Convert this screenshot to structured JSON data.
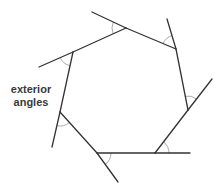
{
  "diagram": {
    "label": {
      "line1": "exterior",
      "line2": "angles",
      "x": 8,
      "y": 83,
      "width": 46
    },
    "colors": {
      "edge": "#333333",
      "arc": "#aaaaaa",
      "text": "#3a3a3a",
      "background": "#ffffff"
    },
    "vertices": [
      {
        "name": "A",
        "x": 126,
        "y": 28
      },
      {
        "name": "B",
        "x": 176,
        "y": 49
      },
      {
        "name": "C",
        "x": 188,
        "y": 110
      },
      {
        "name": "D",
        "x": 155,
        "y": 153
      },
      {
        "name": "E",
        "x": 97,
        "y": 153
      },
      {
        "name": "F",
        "x": 60,
        "y": 112
      },
      {
        "name": "G",
        "x": 73,
        "y": 52
      }
    ],
    "extensions": [
      {
        "from": "A",
        "to_x": 92,
        "to_y": 12
      },
      {
        "from": "B",
        "to_x": 167,
        "to_y": 19
      },
      {
        "from": "C",
        "to_x": 212,
        "to_y": 79
      },
      {
        "from": "D",
        "to_x": 190,
        "to_y": 153
      },
      {
        "from": "E",
        "to_x": 118,
        "to_y": 182
      },
      {
        "from": "F",
        "to_x": 52,
        "to_y": 147
      },
      {
        "from": "G",
        "to_x": 39,
        "to_y": 67
      }
    ],
    "arc_radius": 14
  }
}
